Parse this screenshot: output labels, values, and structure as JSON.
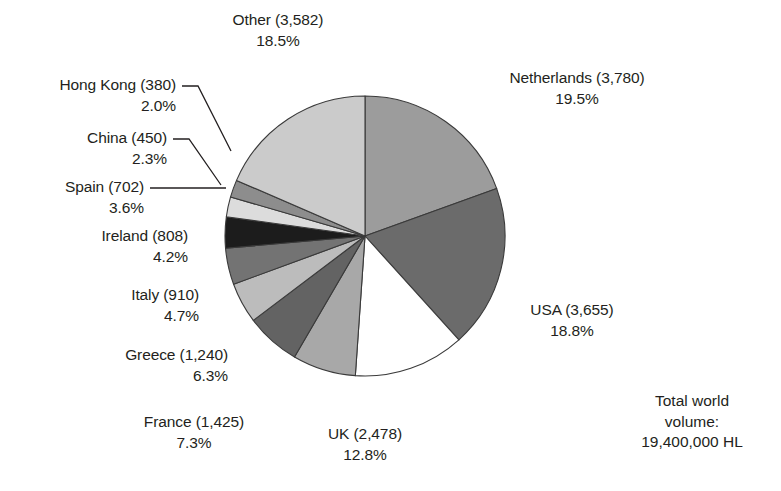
{
  "chart_data": {
    "type": "pie",
    "title": "",
    "subtitle": "",
    "xlabel": "",
    "ylabel": "",
    "legend_position": "none",
    "grid": false,
    "units": "thousand HL",
    "total_label": "Total world volume:",
    "total_value": "19,400,000 HL",
    "start_angle_deg": 0,
    "direction": "clockwise",
    "categories": [
      "Netherlands",
      "USA",
      "UK",
      "France",
      "Greece",
      "Italy",
      "Ireland",
      "Spain",
      "China",
      "Hong Kong",
      "Other"
    ],
    "values": [
      3780,
      3655,
      2478,
      1425,
      1240,
      910,
      808,
      702,
      450,
      380,
      3582
    ],
    "percentages": [
      19.5,
      18.8,
      12.8,
      7.3,
      6.3,
      4.7,
      4.2,
      3.6,
      2.3,
      2.0,
      18.5
    ],
    "colors": [
      "#9c9c9c",
      "#6b6b6b",
      "#ffffff",
      "#a8a8a8",
      "#636363",
      "#bcbcbc",
      "#737373",
      "#1c1c1c",
      "#dcdcdc",
      "#8d8d8d",
      "#cbcbcb"
    ],
    "slices": [
      {
        "name": "Netherlands",
        "value": 3780,
        "percent": 19.5,
        "color": "#9c9c9c",
        "label_line1": "Netherlands (3,780)",
        "label_line2": "19.5%"
      },
      {
        "name": "USA",
        "value": 3655,
        "percent": 18.8,
        "color": "#6b6b6b",
        "label_line1": "USA (3,655)",
        "label_line2": "18.8%"
      },
      {
        "name": "UK",
        "value": 2478,
        "percent": 12.8,
        "color": "#ffffff",
        "label_line1": "UK (2,478)",
        "label_line2": "12.8%"
      },
      {
        "name": "France",
        "value": 1425,
        "percent": 7.3,
        "color": "#a8a8a8",
        "label_line1": "France (1,425)",
        "label_line2": "7.3%"
      },
      {
        "name": "Greece",
        "value": 1240,
        "percent": 6.3,
        "color": "#636363",
        "label_line1": "Greece (1,240)",
        "label_line2": "6.3%"
      },
      {
        "name": "Italy",
        "value": 910,
        "percent": 4.7,
        "color": "#bcbcbc",
        "label_line1": "Italy (910)",
        "label_line2": "4.7%"
      },
      {
        "name": "Ireland",
        "value": 808,
        "percent": 4.2,
        "color": "#737373",
        "label_line1": "Ireland (808)",
        "label_line2": "4.2%"
      },
      {
        "name": "Spain",
        "value": 702,
        "percent": 3.6,
        "color": "#1c1c1c",
        "label_line1": "Spain (702)",
        "label_line2": "3.6%"
      },
      {
        "name": "China",
        "value": 450,
        "percent": 2.3,
        "color": "#dcdcdc",
        "label_line1": "China (450)",
        "label_line2": "2.3%"
      },
      {
        "name": "Hong Kong",
        "value": 380,
        "percent": 2.0,
        "color": "#8d8d8d",
        "label_line1": "Hong Kong (380)",
        "label_line2": "2.0%"
      },
      {
        "name": "Other",
        "value": 3582,
        "percent": 18.5,
        "color": "#cbcbcb",
        "label_line1": "Other (3,582)",
        "label_line2": "18.5%"
      }
    ]
  },
  "annotations": {
    "total": {
      "line1": "Total world",
      "line2": "volume:",
      "line3": "19,400,000 HL"
    }
  }
}
